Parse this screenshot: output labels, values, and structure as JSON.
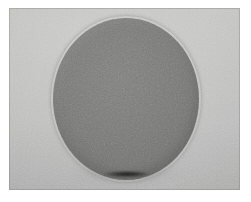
{
  "image": {
    "caption": "Grayscale photograph of a large dark gray sphere resting on a lighter gray surface",
    "subject": "sphere",
    "alt_text": "Dark gray sphere centered on a light gray background with a dark contact shadow beneath it",
    "width_px": 251,
    "height_px": 202
  },
  "frame": {
    "margin_color": "#ffffff",
    "plate_left_px": 9,
    "plate_top_px": 8,
    "plate_width_px": 231,
    "plate_height_px": 182
  },
  "background": {
    "label": "light gray backdrop",
    "highlight_color": "#c8c8c6",
    "midtone_color": "#bababa",
    "shadow_color": "#ababab"
  },
  "sphere": {
    "label": "dark gray sphere",
    "center_x_px": 126,
    "center_y_px": 99,
    "width_px": 146,
    "height_px": 162,
    "highlight_color": "#7f7f7e",
    "midtone_color": "#787877",
    "rim_color": "#686867"
  },
  "shadow": {
    "label": "contact shadow",
    "core_color": "#1d1d1d",
    "soft_color": "#4a4a4a",
    "center_x_px": 127,
    "center_y_px": 174
  }
}
